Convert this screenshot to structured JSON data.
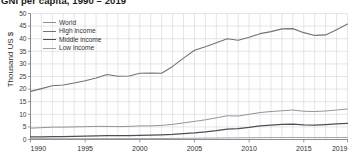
{
  "chart_data": {
    "type": "line",
    "title": "GNI per capita, 1990 – 2019",
    "xlabel": "",
    "ylabel": "Thousand US $",
    "xlim": [
      1990,
      2019
    ],
    "ylim": [
      0,
      50
    ],
    "grid": true,
    "legend_position": "top-left inside plot",
    "x": [
      1990,
      1991,
      1992,
      1993,
      1994,
      1995,
      1996,
      1997,
      1998,
      1999,
      2000,
      2001,
      2002,
      2003,
      2004,
      2005,
      2006,
      2007,
      2008,
      2009,
      2010,
      2011,
      2012,
      2013,
      2014,
      2015,
      2016,
      2017,
      2018,
      2019
    ],
    "x_tick_labels": [
      "1990",
      "1995",
      "2000",
      "2005",
      "2010",
      "2015",
      "2019"
    ],
    "x_ticks": [
      1990,
      1995,
      2000,
      2005,
      2010,
      2015,
      2019
    ],
    "y_ticks": [
      0,
      5,
      10,
      15,
      20,
      25,
      30,
      35,
      40,
      45,
      50
    ],
    "y_tick_labels": [
      "0",
      "5",
      "10",
      "15",
      "20",
      "25",
      "30",
      "35",
      "40",
      "45",
      "50"
    ],
    "series": [
      {
        "name": "World",
        "color": "#8a8f96",
        "values": [
          4.5,
          4.7,
          4.9,
          4.9,
          5.0,
          5.1,
          5.2,
          5.2,
          5.1,
          5.2,
          5.4,
          5.4,
          5.6,
          6.0,
          6.6,
          7.2,
          7.8,
          8.6,
          9.4,
          9.3,
          10.0,
          10.7,
          11.1,
          11.4,
          11.7,
          11.2,
          11.1,
          11.3,
          11.7,
          12.1
        ],
        "style": "solid"
      },
      {
        "name": "High income",
        "color": "#6f7479",
        "values": [
          19.1,
          20.2,
          21.3,
          21.6,
          22.4,
          23.3,
          24.4,
          25.8,
          25.1,
          25.2,
          26.3,
          26.4,
          26.3,
          29.0,
          32.3,
          35.4,
          36.8,
          38.4,
          40.0,
          39.4,
          40.6,
          42.0,
          42.8,
          43.9,
          44.0,
          42.4,
          41.3,
          41.5,
          43.6,
          45.8
        ],
        "style": "solid"
      },
      {
        "name": "Middle income",
        "color": "#4c5054",
        "values": [
          1.0,
          1.05,
          1.1,
          1.15,
          1.2,
          1.3,
          1.4,
          1.5,
          1.5,
          1.5,
          1.6,
          1.7,
          1.8,
          2.0,
          2.3,
          2.6,
          3.0,
          3.5,
          4.1,
          4.3,
          4.8,
          5.4,
          5.7,
          6.0,
          6.1,
          5.8,
          5.7,
          5.9,
          6.2,
          6.4
        ],
        "style": "solid"
      },
      {
        "name": "Low income",
        "color": "#9ba0a6",
        "values": [
          0.33,
          0.33,
          0.32,
          0.31,
          0.31,
          0.33,
          0.35,
          0.36,
          0.36,
          0.36,
          0.36,
          0.37,
          0.38,
          0.42,
          0.46,
          0.5,
          0.54,
          0.58,
          0.64,
          0.66,
          0.7,
          0.74,
          0.77,
          0.79,
          0.8,
          0.78,
          0.76,
          0.77,
          0.79,
          0.81
        ],
        "style": "solid"
      }
    ]
  },
  "legend": {
    "items": [
      {
        "label": "World"
      },
      {
        "label": "High income"
      },
      {
        "label": "Middle income"
      },
      {
        "label": "Low income"
      }
    ]
  },
  "colors": {
    "grid": "#c9ccd4",
    "axis": "#6e7277",
    "background": "#ffffff",
    "text": "#2f2f2f"
  }
}
